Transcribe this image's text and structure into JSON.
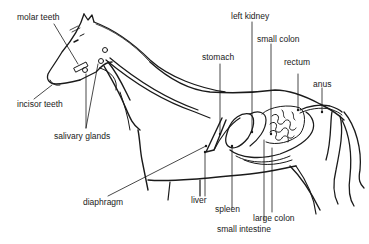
{
  "diagram": {
    "labels": {
      "molar_teeth": "molar teeth",
      "incisor_teeth": "incisor teeth",
      "salivary_glands": "salivary glands",
      "diaphragm": "diaphragm",
      "stomach": "stomach",
      "left_kidney": "left kidney",
      "small_colon": "small colon",
      "rectum": "rectum",
      "anus": "anus",
      "liver": "liver",
      "spleen": "spleen",
      "large_colon": "large colon",
      "small_intestine": "small intestine"
    },
    "colors": {
      "line": "#1a1a1a",
      "background": "#ffffff"
    }
  }
}
